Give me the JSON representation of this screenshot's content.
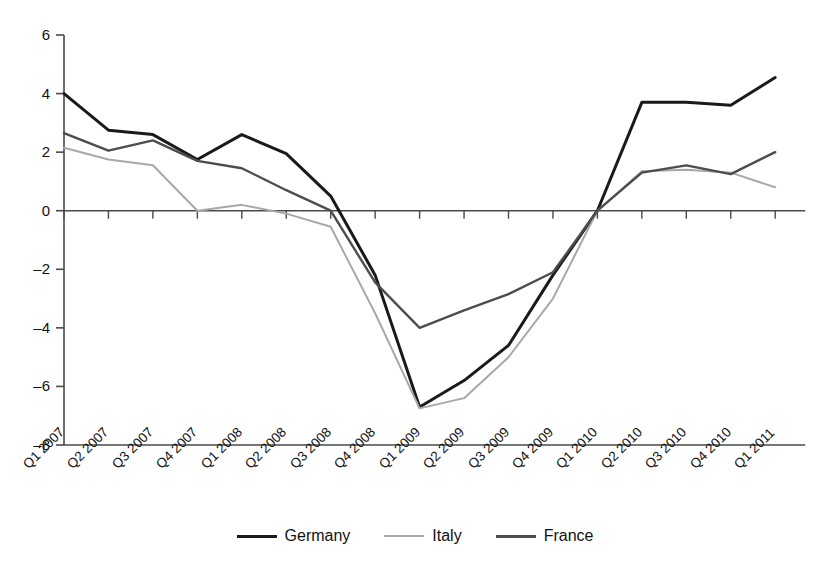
{
  "chart_data": {
    "type": "line",
    "title": "",
    "subtitle": "",
    "xlabel": "",
    "ylabel": "",
    "ylim": [
      -8,
      6
    ],
    "yticks": [
      6,
      4,
      2,
      0,
      -2,
      -4,
      -6,
      -8
    ],
    "ytick_labels": [
      "6",
      "4",
      "2",
      "0",
      "–2",
      "–4",
      "–6",
      "–8"
    ],
    "grid": false,
    "legend_position": "bottom-center",
    "categories": [
      "Q1 2007",
      "Q2 2007",
      "Q3 2007",
      "Q4 2007",
      "Q1 2008",
      "Q2 2008",
      "Q3 2008",
      "Q4 2008",
      "Q1 2009",
      "Q2 2009",
      "Q3 2009",
      "Q4 2009",
      "Q1 2010",
      "Q2 2010",
      "Q3 2010",
      "Q4 2010",
      "Q1 2011"
    ],
    "series": [
      {
        "name": "Germany",
        "color": "#1a1a1a",
        "width": 3.0,
        "values": [
          4.0,
          2.75,
          2.6,
          1.75,
          2.6,
          1.95,
          0.5,
          -2.2,
          -6.7,
          -5.8,
          -4.6,
          -2.2,
          0.0,
          3.7,
          3.7,
          3.6,
          4.55
        ]
      },
      {
        "name": "Italy",
        "color": "#a8a8a8",
        "width": 2.0,
        "values": [
          2.15,
          1.75,
          1.55,
          0.0,
          0.2,
          -0.1,
          -0.55,
          -3.5,
          -6.75,
          -6.4,
          -5.0,
          -3.0,
          0.0,
          1.35,
          1.4,
          1.3,
          0.8
        ]
      },
      {
        "name": "France",
        "color": "#4d4d4d",
        "width": 2.4,
        "values": [
          2.65,
          2.05,
          2.4,
          1.7,
          1.45,
          0.7,
          0.0,
          -2.45,
          -4.0,
          -3.4,
          -2.85,
          -2.1,
          0.0,
          1.3,
          1.55,
          1.25,
          2.0
        ]
      }
    ]
  },
  "legend": {
    "items": [
      {
        "label": "Germany",
        "color": "#1a1a1a",
        "width": 3.5
      },
      {
        "label": "Italy",
        "color": "#a8a8a8",
        "width": 2.5
      },
      {
        "label": "France",
        "color": "#4d4d4d",
        "width": 3.0
      }
    ]
  },
  "axes": {
    "zero_line_value": 0,
    "axis_color": "#4a4a4a"
  }
}
